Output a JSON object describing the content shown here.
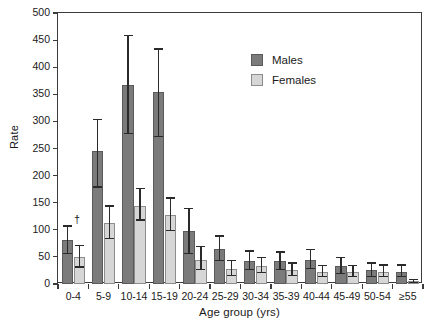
{
  "chart_data": {
    "type": "bar",
    "title": "",
    "xlabel": "Age group (yrs)",
    "ylabel": "Rate",
    "categories": [
      "0-4",
      "5-9",
      "10-14",
      "15-19",
      "20-24",
      "25-29",
      "30-34",
      "35-39",
      "40-44",
      "45-49",
      "50-54",
      "≥55"
    ],
    "ylim": [
      0,
      500
    ],
    "yticks": [
      0,
      50,
      100,
      150,
      200,
      250,
      300,
      350,
      400,
      450,
      500
    ],
    "ytick_labels": [
      "0",
      "50",
      "100",
      "150",
      "200",
      "250",
      "300",
      "350",
      "400",
      "450",
      "500"
    ],
    "grid": false,
    "legend_position": "upper-right-inside",
    "series": [
      {
        "name": "Males",
        "color": "#7b7b7b",
        "values": [
          82,
          245,
          368,
          355,
          97,
          65,
          43,
          42,
          44,
          33,
          25,
          23
        ],
        "err_low": [
          55,
          178,
          277,
          271,
          55,
          42,
          25,
          25,
          27,
          18,
          13,
          12
        ],
        "err_high": [
          108,
          305,
          460,
          435,
          140,
          90,
          62,
          60,
          65,
          50,
          40,
          36
        ]
      },
      {
        "name": "Females",
        "color": "#d6d6d6",
        "values": [
          50,
          112,
          144,
          127,
          45,
          28,
          33,
          25,
          22,
          22,
          23,
          5
        ],
        "err_low": [
          30,
          83,
          117,
          97,
          25,
          15,
          20,
          15,
          12,
          12,
          13,
          2
        ],
        "err_high": [
          72,
          145,
          178,
          160,
          70,
          45,
          50,
          40,
          35,
          35,
          36,
          10
        ]
      }
    ],
    "annotations": [
      {
        "text": "†",
        "category": "0-4",
        "series": "Males",
        "note": "dagger footnote marker above males 0-4 error bar"
      }
    ]
  },
  "legend": {
    "items": [
      {
        "label": "Males",
        "swatch": "males-swatch"
      },
      {
        "label": "Females",
        "swatch": "females-swatch"
      }
    ]
  }
}
